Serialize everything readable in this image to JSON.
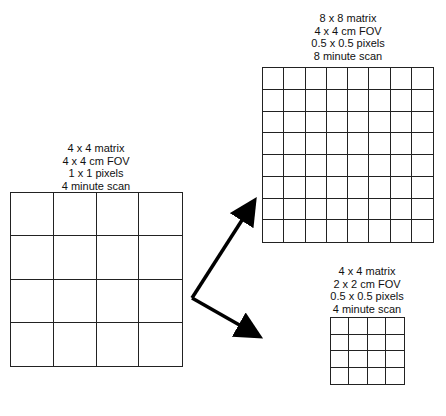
{
  "diagrams": {
    "original": {
      "lines": [
        "4 x 4 matrix",
        "4 x 4 cm FOV",
        "1 x 1 pixels",
        "4 minute scan"
      ],
      "rows": 4,
      "cols": 4
    },
    "high_res": {
      "lines": [
        "8 x 8 matrix",
        "4 x 4 cm FOV",
        "0.5 x 0.5 pixels",
        "8 minute scan"
      ],
      "rows": 8,
      "cols": 8
    },
    "small_fov": {
      "lines": [
        "4 x 4 matrix",
        "2 x 2 cm FOV",
        "0.5 x 0.5 pixels",
        "4 minute scan"
      ],
      "rows": 4,
      "cols": 4
    }
  },
  "colors": {
    "line": "#222222",
    "arrow": "#000000",
    "background": "#ffffff"
  }
}
